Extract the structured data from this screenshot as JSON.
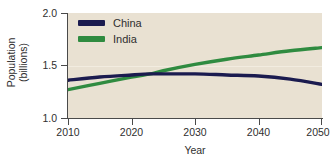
{
  "chart_data": {
    "type": "line",
    "title": "",
    "xlabel": "Year",
    "ylabel": "Population (billions)",
    "ylabel_lines": [
      "Population",
      "(billions)"
    ],
    "xlim": [
      2010,
      2050
    ],
    "ylim": [
      1.0,
      2.0
    ],
    "xticks": [
      2010,
      2020,
      2030,
      2040,
      2050
    ],
    "xtick_labels": [
      "2010",
      "2020",
      "2030",
      "2040",
      "2050"
    ],
    "yticks": [
      1.0,
      1.5,
      2.0
    ],
    "ytick_labels": [
      "1.0",
      "1.5",
      "2.0"
    ],
    "grid": "horizontal-faint-at-1.5",
    "legend_position": "top-left-inside",
    "plot_background": "#e9e1d2",
    "x": [
      2010,
      2015,
      2020,
      2023,
      2025,
      2030,
      2035,
      2040,
      2045,
      2050
    ],
    "series": [
      {
        "name": "China",
        "color": "#1b1b4f",
        "values": [
          1.36,
          1.39,
          1.41,
          1.42,
          1.42,
          1.42,
          1.41,
          1.4,
          1.37,
          1.32
        ]
      },
      {
        "name": "India",
        "color": "#2f8b40",
        "values": [
          1.27,
          1.33,
          1.39,
          1.42,
          1.45,
          1.51,
          1.56,
          1.6,
          1.64,
          1.67
        ]
      }
    ],
    "annotations": [
      "India overtakes China around 2023"
    ]
  },
  "legend": {
    "items": [
      {
        "label": "China",
        "color": "#1b1b4f"
      },
      {
        "label": "India",
        "color": "#2f8b40"
      }
    ]
  },
  "axes": {
    "x_title": "Year",
    "y_title_line1": "Population",
    "y_title_line2": "(billions)",
    "x_tick_0": "2010",
    "x_tick_1": "2020",
    "x_tick_2": "2030",
    "x_tick_3": "2040",
    "x_tick_4": "2050",
    "y_tick_0": "1.0",
    "y_tick_1": "1.5",
    "y_tick_2": "2.0"
  },
  "bottom_clip": {
    "text": ""
  }
}
